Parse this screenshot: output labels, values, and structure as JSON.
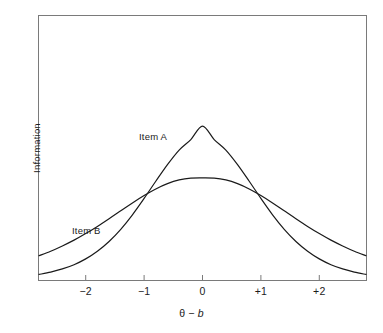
{
  "chart_data": {
    "type": "line",
    "title": "",
    "xlabel": "θ − b",
    "ylabel": "Information",
    "xlim": [
      -2.8,
      2.8
    ],
    "ylim": [
      0,
      1.0
    ],
    "grid": false,
    "legend_position": "inline-annotations",
    "x_ticks": [
      {
        "value": -2,
        "label": "−2"
      },
      {
        "value": -1,
        "label": "−1"
      },
      {
        "value": 0,
        "label": "0"
      },
      {
        "value": 1,
        "label": "+1"
      },
      {
        "value": 2,
        "label": "+2"
      }
    ],
    "y_ticks": [],
    "annotations": [
      {
        "text": "Item A",
        "x": -1.08,
        "y": 0.6
      },
      {
        "text": "Item B",
        "x": -2.22,
        "y": 0.215
      }
    ],
    "series": [
      {
        "name": "Item A",
        "model": "logistic-information",
        "discrimination": 1.75,
        "peak_x": 0,
        "peak_y": 0.583,
        "color": "#1a1a1a",
        "x": [
          -2.8,
          -2.6,
          -2.4,
          -2.2,
          -2.0,
          -1.8,
          -1.6,
          -1.4,
          -1.2,
          -1.0,
          -0.8,
          -0.6,
          -0.4,
          -0.2,
          0.0,
          0.2,
          0.4,
          0.6,
          0.8,
          1.0,
          1.2,
          1.4,
          1.6,
          1.8,
          2.0,
          2.2,
          2.4,
          2.6,
          2.8
        ],
        "y": [
          0.021,
          0.03,
          0.042,
          0.058,
          0.08,
          0.109,
          0.146,
          0.192,
          0.247,
          0.309,
          0.374,
          0.437,
          0.492,
          0.532,
          0.583,
          0.532,
          0.492,
          0.437,
          0.374,
          0.309,
          0.247,
          0.192,
          0.146,
          0.109,
          0.08,
          0.058,
          0.042,
          0.03,
          0.021
        ]
      },
      {
        "name": "Item B",
        "model": "logistic-information",
        "discrimination": 1.0,
        "peak_x": 0,
        "peak_y": 0.387,
        "color": "#1a1a1a",
        "x": [
          -2.8,
          -2.6,
          -2.4,
          -2.2,
          -2.0,
          -1.8,
          -1.6,
          -1.4,
          -1.2,
          -1.0,
          -0.8,
          -0.6,
          -0.4,
          -0.2,
          0.0,
          0.2,
          0.4,
          0.6,
          0.8,
          1.0,
          1.2,
          1.4,
          1.6,
          1.8,
          2.0,
          2.2,
          2.4,
          2.6,
          2.8
        ],
        "y": [
          0.092,
          0.109,
          0.129,
          0.151,
          0.176,
          0.203,
          0.232,
          0.262,
          0.292,
          0.32,
          0.345,
          0.365,
          0.379,
          0.386,
          0.387,
          0.386,
          0.379,
          0.365,
          0.345,
          0.32,
          0.292,
          0.262,
          0.232,
          0.203,
          0.176,
          0.151,
          0.129,
          0.109,
          0.092
        ]
      }
    ]
  },
  "axes": {
    "y_title": "Information",
    "x_title_theta": "θ",
    "x_title_minus": "−",
    "x_title_b": "b"
  },
  "style": {
    "frame_color": "#7a7a7a",
    "curve_color": "#1a1a1a",
    "text_color": "#1b1b1b",
    "background": "#ffffff"
  }
}
